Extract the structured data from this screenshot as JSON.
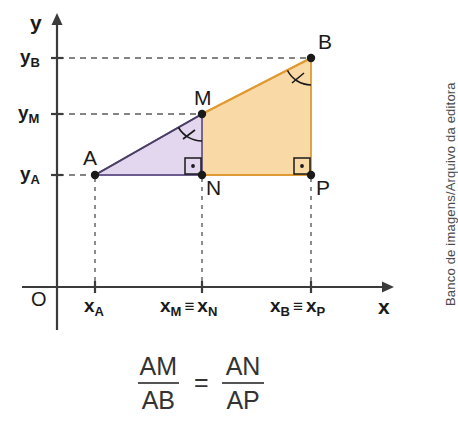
{
  "figure": {
    "axes": {
      "y_label": "y",
      "x_label": "x",
      "origin_label": "O"
    },
    "y_ticks": [
      {
        "base": "y",
        "sub": "B",
        "name": "y-tick-B"
      },
      {
        "base": "y",
        "sub": "M",
        "name": "y-tick-M"
      },
      {
        "base": "y",
        "sub": "A",
        "name": "y-tick-A"
      }
    ],
    "x_ticks": [
      {
        "base": "x",
        "sub": "A",
        "name": "x-tick-A"
      },
      {
        "base": "x",
        "sub": "M",
        "sub2": "N",
        "equiv": "≡",
        "name": "x-tick-M-N"
      },
      {
        "base": "x",
        "sub": "B",
        "sub2": "P",
        "equiv": "≡",
        "name": "x-tick-B-P"
      }
    ],
    "points": [
      {
        "label": "A",
        "name": "point-A"
      },
      {
        "label": "M",
        "name": "point-M"
      },
      {
        "label": "B",
        "name": "point-B"
      },
      {
        "label": "N",
        "name": "point-N"
      },
      {
        "label": "P",
        "name": "point-P"
      }
    ],
    "regions": [
      {
        "name": "triangle-AMN",
        "fill": "#e3d6ef",
        "stroke": "#6b5b8e"
      },
      {
        "name": "quadrilateral-MNPB",
        "fill": "#f9d9a6",
        "stroke": "#e09a33"
      }
    ],
    "angle_marks": [
      {
        "name": "angle-at-M",
        "vertex": "M",
        "ticks": 1
      },
      {
        "name": "angle-at-B",
        "vertex": "B",
        "ticks": 1
      }
    ],
    "right_angles": [
      {
        "name": "right-angle-at-N",
        "vertex": "N"
      },
      {
        "name": "right-angle-at-P",
        "vertex": "P"
      }
    ]
  },
  "formula": {
    "left": {
      "numerator": "AM",
      "denominator": "AB"
    },
    "operator": "=",
    "right": {
      "numerator": "AN",
      "denominator": "AP"
    }
  },
  "credit": {
    "text": "Banco de imagens/Arquivo da editora"
  },
  "colors": {
    "purple_fill": "#e3d6ef",
    "purple_stroke": "#6b5b8e",
    "orange_fill": "#f9d9a6",
    "orange_stroke": "#e09a33",
    "axis": "#3b3b3b",
    "text": "#1a1a1a"
  }
}
